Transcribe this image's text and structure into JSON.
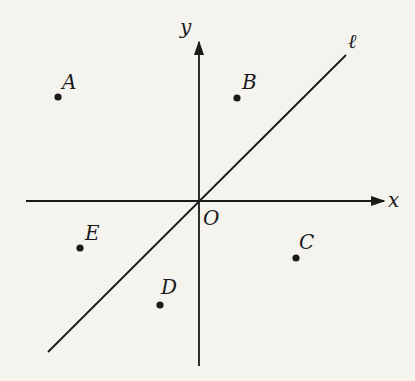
{
  "diagram": {
    "type": "coordinate-plane",
    "colors": {
      "background": "#f5f3ee",
      "ink": "#1a1a1a"
    },
    "axes": {
      "origin": {
        "label": "O",
        "px": [
          199,
          201
        ]
      },
      "x": {
        "label": "x",
        "from": [
          26,
          201
        ],
        "to": [
          386,
          201
        ]
      },
      "y": {
        "label": "y",
        "from": [
          199,
          366
        ],
        "to": [
          199,
          40
        ]
      }
    },
    "line": {
      "label": "ℓ",
      "from": [
        48,
        352
      ],
      "to": [
        346,
        55
      ],
      "description": "line through origin, slope 1 (y = x)"
    },
    "points": [
      {
        "label": "A",
        "px": [
          58,
          97
        ],
        "quadrant": "II"
      },
      {
        "label": "B",
        "px": [
          237,
          98
        ],
        "quadrant": "I"
      },
      {
        "label": "C",
        "px": [
          296,
          258
        ],
        "quadrant": "IV"
      },
      {
        "label": "D",
        "px": [
          160,
          305
        ],
        "quadrant": "III"
      },
      {
        "label": "E",
        "px": [
          80,
          248
        ],
        "quadrant": "III"
      }
    ]
  }
}
